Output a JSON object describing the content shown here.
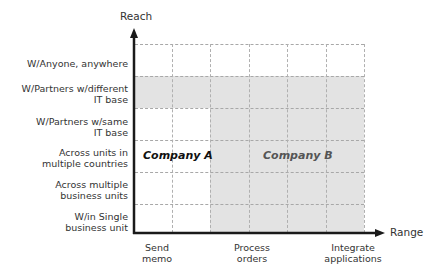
{
  "diagram": {
    "y_axis": {
      "title": "Reach"
    },
    "x_axis": {
      "title": "Range"
    },
    "rows": [
      {
        "lines": [
          "W/Anyone, anywhere"
        ]
      },
      {
        "lines": [
          "W/Partners w/different",
          "IT base"
        ]
      },
      {
        "lines": [
          "W/Partners w/same",
          "IT base"
        ]
      },
      {
        "lines": [
          "Across units in",
          "multiple countries"
        ]
      },
      {
        "lines": [
          "Across multiple",
          "business units"
        ]
      },
      {
        "lines": [
          "W/in Single",
          "business unit"
        ]
      }
    ],
    "columns": [
      {
        "lines": [
          "Send",
          "memo"
        ]
      },
      {
        "lines": [
          "Process",
          "orders"
        ]
      },
      {
        "lines": [
          "Integrate",
          "applications"
        ]
      }
    ],
    "regions": [
      {
        "label": "Company A",
        "color": "#111111",
        "shaded": false
      },
      {
        "label": "Company B",
        "color": "#555555",
        "shaded": true,
        "fill": "#e3e3e3"
      }
    ],
    "colors": {
      "shade": "#e3e3e3",
      "grid": "#a8a8a8",
      "axis": "#1a1a1a"
    }
  }
}
